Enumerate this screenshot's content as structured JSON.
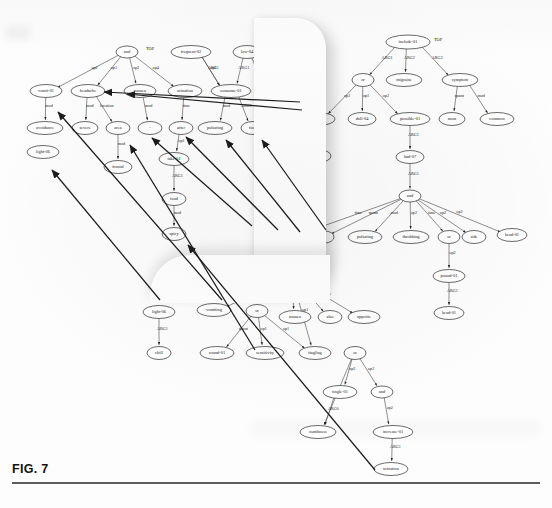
{
  "figure": {
    "caption": "FIG. 7",
    "type": "amr-graph-diagram"
  },
  "colors": {
    "node_fill": "#ffffff",
    "node_stroke": "#2b2b2b",
    "edge": "#333333",
    "text": "#1a1a1a",
    "arrow": "#1c1c1c",
    "caption_rule": "#5d5d5d"
  },
  "graph_left": {
    "name": "left-amr-graph",
    "nodes": [
      {
        "id": "l_and",
        "label": "and",
        "x": 127,
        "y": 52,
        "rx": 11,
        "ry": 6
      },
      {
        "id": "l_top",
        "label": "TOP",
        "x": 150,
        "y": 49,
        "rx": 0,
        "ry": 0,
        "plain": true
      },
      {
        "id": "l_frequent",
        "label": "frequent-02",
        "x": 191,
        "y": 52,
        "rx": 20,
        "ry": 6.5
      },
      {
        "id": "l_low",
        "label": "low-04",
        "x": 247,
        "y": 52,
        "rx": 14,
        "ry": 6.5
      },
      {
        "id": "l_vomit",
        "label": "vomit-01",
        "x": 46,
        "y": 91,
        "rx": 16,
        "ry": 6.5
      },
      {
        "id": "l_headache",
        "label": "headache",
        "x": 88,
        "y": 91,
        "rx": 17,
        "ry": 6.5
      },
      {
        "id": "l_nausea",
        "label": "nausea",
        "x": 140,
        "y": 91,
        "rx": 16,
        "ry": 6.5
      },
      {
        "id": "l_urination",
        "label": "urination",
        "x": 185,
        "y": 91,
        "rx": 17,
        "ry": 6.5
      },
      {
        "id": "l_consume",
        "label": "consume-01",
        "x": 231,
        "y": 91,
        "rx": 20,
        "ry": 6.5
      },
      {
        "id": "l_very",
        "label": "very",
        "x": 267,
        "y": 91,
        "rx": 12,
        "ry": 6.5
      },
      {
        "id": "l_avoidance",
        "label": "avoidance",
        "x": 45,
        "y": 128,
        "rx": 18,
        "ry": 6.5
      },
      {
        "id": "l_severe",
        "label": "severe",
        "x": 85,
        "y": 128,
        "rx": 13,
        "ry": 6.5
      },
      {
        "id": "l_area",
        "label": "area",
        "x": 118,
        "y": 128,
        "rx": 12,
        "ry": 6.5
      },
      {
        "id": "l_dot",
        "label": "-",
        "x": 150,
        "y": 128,
        "rx": 12,
        "ry": 6.5
      },
      {
        "id": "l_after",
        "label": "after",
        "x": 181,
        "y": 128,
        "rx": 12,
        "ry": 6.5
      },
      {
        "id": "l_pulsating",
        "label": "pulsating",
        "x": 215,
        "y": 128,
        "rx": 17,
        "ry": 6.5
      },
      {
        "id": "l_food1",
        "label": "food",
        "x": 253,
        "y": 128,
        "rx": 12,
        "ry": 6.5
      },
      {
        "id": "l_frontal",
        "label": "frontal",
        "x": 118,
        "y": 167,
        "rx": 14,
        "ry": 6.5
      },
      {
        "id": "l_take",
        "label": "take-01",
        "x": 174,
        "y": 159,
        "rx": 15,
        "ry": 6.5
      },
      {
        "id": "l_light06",
        "label": "light-06",
        "x": 43,
        "y": 152,
        "rx": 16,
        "ry": 6.5
      },
      {
        "id": "l_food2",
        "label": "food",
        "x": 174,
        "y": 199,
        "rx": 12,
        "ry": 6.5
      },
      {
        "id": "l_spicy",
        "label": "spicy",
        "x": 174,
        "y": 234,
        "rx": 12,
        "ry": 6.5
      }
    ],
    "edges": [
      {
        "from": "l_and",
        "to": "l_vomit",
        "label": "op2"
      },
      {
        "from": "l_and",
        "to": "l_headache",
        "label": "op1"
      },
      {
        "from": "l_and",
        "to": "l_nausea",
        "label": "op2"
      },
      {
        "from": "l_and",
        "to": "l_urination",
        "label": "op4"
      },
      {
        "from": "l_frequent",
        "to": "l_consume",
        "label": "op1"
      },
      {
        "from": "l_frequent",
        "to": "l_consume",
        "label": "ARG1"
      },
      {
        "from": "l_low",
        "to": "l_consume",
        "label": "ARG1"
      },
      {
        "from": "l_low",
        "to": "l_very",
        "label": "degree"
      },
      {
        "from": "l_vomit",
        "to": "l_avoidance",
        "label": "mod"
      },
      {
        "from": "l_headache",
        "to": "l_severe",
        "label": "mod"
      },
      {
        "from": "l_headache",
        "to": "l_area",
        "label": "location"
      },
      {
        "from": "l_nausea",
        "to": "l_dot",
        "label": "mod"
      },
      {
        "from": "l_urination",
        "to": "l_after",
        "label": "time"
      },
      {
        "from": "l_consume",
        "to": "l_pulsating",
        "label": "mod"
      },
      {
        "from": "l_consume",
        "to": "l_food1",
        "label": "ARG1"
      },
      {
        "from": "l_area",
        "to": "l_frontal",
        "label": "mod"
      },
      {
        "from": "l_after",
        "to": "l_take",
        "label": "op1"
      },
      {
        "from": "l_take",
        "to": "l_food2",
        "label": "ARG1"
      },
      {
        "from": "l_food2",
        "to": "l_spicy",
        "label": "mod"
      }
    ]
  },
  "graph_right": {
    "name": "right-amr-graph",
    "nodes": [
      {
        "id": "r_include",
        "label": "include-01",
        "x": 408,
        "y": 42,
        "rx": 22,
        "ry": 7
      },
      {
        "id": "r_top",
        "label": "TOP",
        "x": 438,
        "y": 40,
        "rx": 0,
        "ry": 0,
        "plain": true
      },
      {
        "id": "r_or1",
        "label": "or",
        "x": 363,
        "y": 80,
        "rx": 11,
        "ry": 6.5
      },
      {
        "id": "r_migraine",
        "label": "migraine",
        "x": 404,
        "y": 80,
        "rx": 18,
        "ry": 6.5
      },
      {
        "id": "r_symptom",
        "label": "symptom",
        "x": 460,
        "y": 80,
        "rx": 18,
        "ry": 6.5
      },
      {
        "id": "r_headache",
        "label": "headache",
        "x": 318,
        "y": 119,
        "rx": 17,
        "ry": 6.5
      },
      {
        "id": "r_dull",
        "label": "dull-04",
        "x": 362,
        "y": 119,
        "rx": 14,
        "ry": 6.5
      },
      {
        "id": "r_possible",
        "label": "possible-01",
        "x": 410,
        "y": 119,
        "rx": 20,
        "ry": 6.5
      },
      {
        "id": "r_most",
        "label": "most",
        "x": 452,
        "y": 119,
        "rx": 13,
        "ry": 6.5
      },
      {
        "id": "r_common",
        "label": "common",
        "x": 497,
        "y": 119,
        "rx": 17,
        "ry": 6.5
      },
      {
        "id": "r_severe",
        "label": "severe",
        "x": 318,
        "y": 156,
        "rx": 13,
        "ry": 6.5
      },
      {
        "id": "r_bad",
        "label": "bad-07",
        "x": 410,
        "y": 157,
        "rx": 14,
        "ry": 6.5
      },
      {
        "id": "r_and1",
        "label": "and",
        "x": 410,
        "y": 196,
        "rx": 11,
        "ry": 6
      },
      {
        "id": "r_and2",
        "label": "and",
        "x": 291,
        "y": 237,
        "rx": 11,
        "ry": 6
      },
      {
        "id": "r_i",
        "label": "I",
        "x": 325,
        "y": 237,
        "rx": 9,
        "ry": 6
      },
      {
        "id": "r_pulsating",
        "label": "pulsating",
        "x": 365,
        "y": 237,
        "rx": 17,
        "ry": 6.5
      },
      {
        "id": "r_throbbing",
        "label": "throbbing",
        "x": 411,
        "y": 237,
        "rx": 18,
        "ry": 6.5
      },
      {
        "id": "r_or2",
        "label": "or",
        "x": 449,
        "y": 237,
        "rx": 11,
        "ry": 6.5
      },
      {
        "id": "r_side",
        "label": "side",
        "x": 474,
        "y": 237,
        "rx": 12,
        "ry": 6.5
      },
      {
        "id": "r_head01a",
        "label": "head-01",
        "x": 512,
        "y": 235,
        "rx": 15,
        "ry": 6.5
      },
      {
        "id": "r_pound",
        "label": "pound-01",
        "x": 449,
        "y": 276,
        "rx": 16,
        "ry": 6.5
      },
      {
        "id": "r_head01b",
        "label": "head-01",
        "x": 449,
        "y": 313,
        "rx": 15,
        "ry": 6.5
      },
      {
        "id": "r_and3",
        "label": "and",
        "x": 291,
        "y": 277,
        "rx": 11,
        "ry": 6
      },
      {
        "id": "r_nausea",
        "label": "nausea",
        "x": 295,
        "y": 317,
        "rx": 16,
        "ry": 6.5
      },
      {
        "id": "r_also",
        "label": "also",
        "x": 330,
        "y": 317,
        "rx": 12,
        "ry": 6.5
      },
      {
        "id": "r_appetite",
        "label": "appetite",
        "x": 364,
        "y": 317,
        "rx": 16,
        "ry": 6.5
      },
      {
        "id": "r_vomiting",
        "label": "vomiting",
        "x": 214,
        "y": 310,
        "rx": 17,
        "ry": 6.5
      },
      {
        "id": "r_or3",
        "label": "or",
        "x": 257,
        "y": 311,
        "rx": 11,
        "ry": 6.5
      },
      {
        "id": "r_light06",
        "label": "light-06",
        "x": 159,
        "y": 312,
        "rx": 16,
        "ry": 6.5
      },
      {
        "id": "r_chill",
        "label": "chill",
        "x": 159,
        "y": 353,
        "rx": 12,
        "ry": 6.5
      },
      {
        "id": "r_sound",
        "label": "sound-01",
        "x": 217,
        "y": 353,
        "rx": 17,
        "ry": 6.5
      },
      {
        "id": "r_sensitivity",
        "label": "sensitivity",
        "x": 265,
        "y": 353,
        "rx": 19,
        "ry": 6.5
      },
      {
        "id": "r_tingling",
        "label": "tingling",
        "x": 315,
        "y": 353,
        "rx": 16,
        "ry": 6.5
      },
      {
        "id": "r_or4",
        "label": "or",
        "x": 355,
        "y": 353,
        "rx": 11,
        "ry": 6.5
      },
      {
        "id": "r_tingle",
        "label": "tingle-01",
        "x": 340,
        "y": 392,
        "rx": 17,
        "ry": 6.5
      },
      {
        "id": "r_and4",
        "label": "and",
        "x": 382,
        "y": 392,
        "rx": 11,
        "ry": 6
      },
      {
        "id": "r_numbness",
        "label": "numbness",
        "x": 318,
        "y": 432,
        "rx": 18,
        "ry": 6.5
      },
      {
        "id": "r_increase",
        "label": "increase-01",
        "x": 393,
        "y": 432,
        "rx": 20,
        "ry": 6.5
      },
      {
        "id": "r_urination",
        "label": "urination",
        "x": 391,
        "y": 469,
        "rx": 17,
        "ry": 6.5
      }
    ],
    "edges": [
      {
        "from": "r_include",
        "to": "r_or1",
        "label": "ARG1"
      },
      {
        "from": "r_include",
        "to": "r_migraine",
        "label": "ARG2"
      },
      {
        "from": "r_include",
        "to": "r_symptom",
        "label": "ARG2"
      },
      {
        "from": "r_or1",
        "to": "r_headache",
        "label": "op2"
      },
      {
        "from": "r_or1",
        "to": "r_dull",
        "label": "op1"
      },
      {
        "from": "r_or1",
        "to": "r_possible",
        "label": "op2"
      },
      {
        "from": "r_symptom",
        "to": "r_most",
        "label": "quant"
      },
      {
        "from": "r_symptom",
        "to": "r_common",
        "label": "mod"
      },
      {
        "from": "r_headache",
        "to": "r_severe",
        "label": "mod"
      },
      {
        "from": "r_possible",
        "to": "r_bad",
        "label": "ARG1"
      },
      {
        "from": "r_bad",
        "to": "r_and1",
        "label": "ARG1"
      },
      {
        "from": "r_and1",
        "to": "r_and2",
        "label": "time"
      },
      {
        "from": "r_and1",
        "to": "r_i",
        "label": "quant"
      },
      {
        "from": "r_and1",
        "to": "r_pulsating",
        "label": "mod"
      },
      {
        "from": "r_and1",
        "to": "r_throbbing",
        "label": "op2"
      },
      {
        "from": "r_and1",
        "to": "r_or2",
        "label": "time"
      },
      {
        "from": "r_and1",
        "to": "r_side",
        "label": "op2"
      },
      {
        "from": "r_and1",
        "to": "r_head01a",
        "label": "op2"
      },
      {
        "from": "r_or2",
        "to": "r_pound",
        "label": "op2"
      },
      {
        "from": "r_pound",
        "to": "r_head01b",
        "label": "ARG1"
      },
      {
        "from": "r_and2",
        "to": "r_and3",
        "label": "op2"
      },
      {
        "from": "r_and3",
        "to": "r_nausea",
        "label": "op1"
      },
      {
        "from": "r_and3",
        "to": "r_also",
        "label": "mod"
      },
      {
        "from": "r_and3",
        "to": "r_appetite",
        "label": "poss"
      },
      {
        "from": "r_and3",
        "to": "r_vomiting",
        "label": "op2"
      },
      {
        "from": "r_and3",
        "to": "r_tingling",
        "label": "op1"
      },
      {
        "from": "r_light06",
        "to": "r_chill",
        "label": "ARG1"
      },
      {
        "from": "r_or3",
        "to": "r_sound",
        "label": "quant"
      },
      {
        "from": "r_or3",
        "to": "r_sensitivity",
        "label": "op1"
      },
      {
        "from": "r_or3",
        "to": "r_tingling",
        "label": "op1"
      },
      {
        "from": "r_or4",
        "to": "r_tingle",
        "label": "op2"
      },
      {
        "from": "r_or4",
        "to": "r_and4",
        "label": "op2"
      },
      {
        "from": "r_or4",
        "to": "r_numbness",
        "label": "op1"
      },
      {
        "from": "r_tingle",
        "to": "r_numbness",
        "label": "ARG0"
      },
      {
        "from": "r_and4",
        "to": "r_increase",
        "label": "op2"
      },
      {
        "from": "r_increase",
        "to": "r_urination",
        "label": "ARG1"
      }
    ]
  },
  "annotation_arrows": [
    {
      "name": "arrow-to-headache",
      "x1": 300,
      "y1": 102,
      "x2": 104,
      "y2": 92
    },
    {
      "name": "arrow-to-nausea",
      "x1": 302,
      "y1": 110,
      "x2": 127,
      "y2": 94
    },
    {
      "name": "arrow-to-dot-node",
      "x1": 252,
      "y1": 226,
      "x2": 152,
      "y2": 138
    },
    {
      "name": "arrow-to-after",
      "x1": 278,
      "y1": 230,
      "x2": 186,
      "y2": 137
    },
    {
      "name": "arrow-to-pulsating",
      "x1": 300,
      "y1": 232,
      "x2": 226,
      "y2": 140
    },
    {
      "name": "arrow-to-food",
      "x1": 326,
      "y1": 230,
      "x2": 262,
      "y2": 140
    },
    {
      "name": "arrow-to-avoidance",
      "x1": 222,
      "y1": 300,
      "x2": 58,
      "y2": 112
    },
    {
      "name": "arrow-to-frontal",
      "x1": 255,
      "y1": 350,
      "x2": 130,
      "y2": 145
    },
    {
      "name": "arrow-to-light06",
      "x1": 160,
      "y1": 300,
      "x2": 52,
      "y2": 170
    },
    {
      "name": "arrow-to-spicy",
      "x1": 375,
      "y1": 470,
      "x2": 188,
      "y2": 245
    }
  ]
}
